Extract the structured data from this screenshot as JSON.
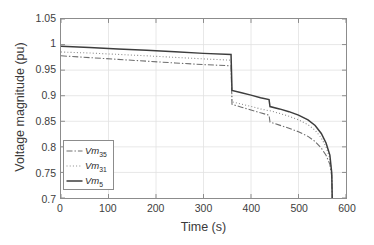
{
  "chart_data": {
    "type": "line",
    "title": "",
    "xlabel": "Time (s)",
    "ylabel": "Voltage magnitude (pu)",
    "xlim": [
      0,
      600
    ],
    "ylim": [
      0.7,
      1.05
    ],
    "xticks": [
      0,
      100,
      200,
      300,
      400,
      500,
      600
    ],
    "xticklabels": [
      "0",
      "100",
      "200",
      "300",
      "400",
      "500",
      "600"
    ],
    "yticks": [
      0.7,
      0.75,
      0.8,
      0.85,
      0.9,
      0.95,
      1.0,
      1.05
    ],
    "yticklabels": [
      "0.7",
      "0.75",
      "0.8",
      "0.85",
      "0.9",
      "0.95",
      "1",
      "1.05"
    ],
    "grid": true,
    "grid_color": "#e2e2e2",
    "axis_color": "#8c8c8c",
    "background": "#ffffff",
    "legend_position": "lower left",
    "series": [
      {
        "name": "Vm35",
        "label_base": "Vm",
        "label_sub": "35",
        "style": "dash-dot",
        "color": "#6e6e6e",
        "width": 1.1,
        "x": [
          0,
          60,
          120,
          180,
          240,
          300,
          358,
          360,
          380,
          400,
          420,
          438,
          440,
          460,
          480,
          500,
          520,
          535,
          548,
          558,
          566,
          570,
          571
        ],
        "y": [
          0.978,
          0.9745,
          0.971,
          0.9675,
          0.964,
          0.9608,
          0.9585,
          0.883,
          0.8775,
          0.872,
          0.8665,
          0.862,
          0.8485,
          0.8425,
          0.8365,
          0.8295,
          0.8205,
          0.8105,
          0.7975,
          0.7835,
          0.766,
          0.742,
          0.7
        ]
      },
      {
        "name": "Vm31",
        "label_base": "Vm",
        "label_sub": "31",
        "style": "dotted",
        "color": "#8a8a8a",
        "width": 1.1,
        "x": [
          0,
          60,
          120,
          180,
          240,
          300,
          358,
          360,
          380,
          400,
          420,
          438,
          440,
          460,
          480,
          500,
          520,
          535,
          548,
          558,
          566,
          570,
          571
        ],
        "y": [
          0.9855,
          0.9835,
          0.9808,
          0.978,
          0.975,
          0.972,
          0.9695,
          0.888,
          0.8835,
          0.879,
          0.8742,
          0.8705,
          0.8705,
          0.8655,
          0.8598,
          0.8528,
          0.8435,
          0.8325,
          0.8175,
          0.7995,
          0.7775,
          0.746,
          0.7
        ]
      },
      {
        "name": "Vm5",
        "label_base": "Vm",
        "label_sub": "5",
        "style": "solid",
        "color": "#3d3d3d",
        "width": 1.5,
        "x": [
          0,
          60,
          120,
          180,
          240,
          300,
          358,
          360,
          380,
          400,
          420,
          438,
          440,
          460,
          480,
          500,
          520,
          535,
          548,
          558,
          566,
          570,
          571
        ],
        "y": [
          0.9968,
          0.9942,
          0.9915,
          0.9888,
          0.9858,
          0.9828,
          0.9805,
          0.9102,
          0.9058,
          0.9012,
          0.8962,
          0.8925,
          0.8788,
          0.8742,
          0.8688,
          0.862,
          0.8528,
          0.8418,
          0.8262,
          0.8075,
          0.784,
          0.749,
          0.7
        ]
      }
    ],
    "annotations": [
      {
        "kind": "vertical-drop",
        "x": 360,
        "note": "contingency / load rejection"
      },
      {
        "kind": "step",
        "x": 440,
        "note": "discrete tap or switching event"
      },
      {
        "kind": "collapse",
        "x": 571,
        "note": "voltage collapse to axis limit"
      }
    ]
  }
}
